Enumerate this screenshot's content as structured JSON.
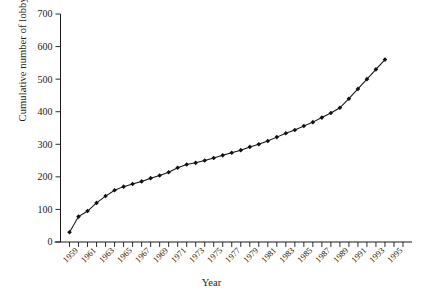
{
  "chart_data": {
    "type": "line",
    "title": "",
    "xlabel": "Year",
    "ylabel": "Cumulative number of lobbying groups",
    "xlim": [
      1957,
      1996
    ],
    "ylim": [
      0,
      700
    ],
    "ytick_values": [
      0,
      100,
      200,
      300,
      400,
      500,
      600,
      700
    ],
    "ytick_labels": [
      "0",
      "100",
      "200",
      "300",
      "400",
      "500",
      "600",
      "700"
    ],
    "xtick_labels": [
      "1959",
      "1961",
      "1963",
      "1965",
      "1967",
      "1969",
      "1971",
      "1973",
      "1975",
      "1977",
      "1979",
      "1981",
      "1983",
      "1985",
      "1987",
      "1989",
      "1991",
      "1993",
      "1995"
    ],
    "xtick_label_values": [
      1959,
      1961,
      1963,
      1965,
      1967,
      1969,
      1971,
      1973,
      1975,
      1977,
      1979,
      1981,
      1983,
      1985,
      1987,
      1989,
      1991,
      1993,
      1995
    ],
    "minor_tick_values": [
      1958,
      1959,
      1960,
      1961,
      1962,
      1963,
      1964,
      1965,
      1966,
      1967,
      1968,
      1969,
      1970,
      1971,
      1972,
      1973,
      1974,
      1975,
      1976,
      1977,
      1978,
      1979,
      1980,
      1981,
      1982,
      1983,
      1984,
      1985,
      1986,
      1987,
      1988,
      1989,
      1990,
      1991,
      1992,
      1993,
      1994,
      1995
    ],
    "grid": false,
    "legend": false,
    "marker": "filled-diamond",
    "line_color": "#111111",
    "x": [
      1958,
      1959,
      1960,
      1961,
      1962,
      1963,
      1964,
      1965,
      1966,
      1967,
      1968,
      1969,
      1970,
      1971,
      1972,
      1973,
      1974,
      1975,
      1976,
      1977,
      1978,
      1979,
      1980,
      1981,
      1982,
      1983,
      1984,
      1985,
      1986,
      1987,
      1988,
      1989,
      1990,
      1991,
      1992,
      1993
    ],
    "values": [
      30,
      78,
      95,
      120,
      141,
      159,
      170,
      178,
      186,
      196,
      204,
      214,
      228,
      238,
      243,
      250,
      258,
      266,
      274,
      282,
      292,
      300,
      310,
      322,
      334,
      344,
      356,
      368,
      382,
      396,
      412,
      440,
      470,
      500,
      530,
      560
    ],
    "series": [
      {
        "name": "Cumulative number of lobbying groups",
        "x": [
          1958,
          1959,
          1960,
          1961,
          1962,
          1963,
          1964,
          1965,
          1966,
          1967,
          1968,
          1969,
          1970,
          1971,
          1972,
          1973,
          1974,
          1975,
          1976,
          1977,
          1978,
          1979,
          1980,
          1981,
          1982,
          1983,
          1984,
          1985,
          1986,
          1987,
          1988,
          1989,
          1990,
          1991,
          1992,
          1993
        ],
        "values": [
          30,
          78,
          95,
          120,
          141,
          159,
          170,
          178,
          186,
          196,
          204,
          214,
          228,
          238,
          243,
          250,
          258,
          266,
          274,
          282,
          292,
          300,
          310,
          322,
          334,
          344,
          356,
          368,
          382,
          396,
          412,
          440,
          470,
          500,
          530,
          560
        ]
      }
    ]
  }
}
